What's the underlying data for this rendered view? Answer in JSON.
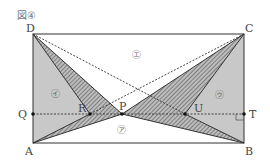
{
  "figure": {
    "caption": "図④",
    "points": {
      "D": {
        "label": "D",
        "x": 33,
        "y": 34
      },
      "C": {
        "label": "C",
        "x": 244,
        "y": 34
      },
      "A": {
        "label": "A",
        "x": 33,
        "y": 143
      },
      "B": {
        "label": "B",
        "x": 244,
        "y": 143
      },
      "Q": {
        "label": "Q",
        "x": 33,
        "y": 114
      },
      "T": {
        "label": "T",
        "x": 244,
        "y": 114
      },
      "R": {
        "label": "R",
        "x": 90,
        "y": 114
      },
      "P": {
        "label": "P",
        "x": 122,
        "y": 114
      },
      "U": {
        "label": "U",
        "x": 185,
        "y": 114
      }
    },
    "regions": {
      "a": "㋐",
      "i": "㋑",
      "u": "㋒",
      "e": "㋓"
    },
    "colors": {
      "line": "#333333",
      "gray_fill": "#c8c8c8",
      "hatch": "#555555",
      "background": "#ffffff"
    }
  }
}
